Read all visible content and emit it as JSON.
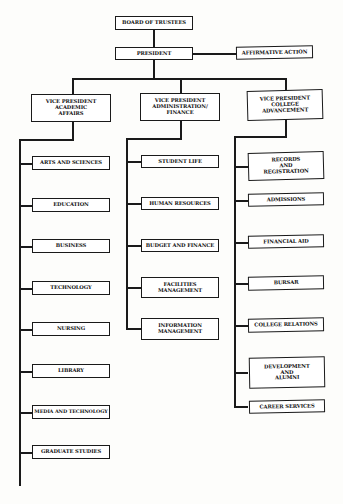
{
  "chart": {
    "board": "BOARD OF TRUSTEES",
    "president": "PRESIDENT",
    "affirmative_action": "AFFIRMATIVE ACTION",
    "vps": [
      {
        "title": "VICE PRESIDENT\nACADEMIC\nAFFAIRS",
        "units": [
          "ARTS AND SCIENCES",
          "EDUCATION",
          "BUSINESS",
          "TECHNOLOGY",
          "NURSING",
          "LIBRARY",
          "MEDIA AND TECHNOLOGY",
          "GRADUATE STUDIES"
        ]
      },
      {
        "title": "VICE PRESIDENT\nADMINISTRATION/\nFINANCE",
        "units": [
          "STUDENT LIFE",
          "HUMAN RESOURCES",
          "BUDGET AND FINANCE",
          "FACILITIES\nMANAGEMENT",
          "INFORMATION\nMANAGEMENT"
        ]
      },
      {
        "title": "VICE PRESIDENT\nCOLLEGE\nADVANCEMENT",
        "units": [
          "RECORDS\nAND\nREGISTRATION",
          "ADMISSIONS",
          "FINANCIAL AID",
          "BURSAR",
          "COLLEGE RELATIONS",
          "DEVELOPMENT\nAND\nALUMNI",
          "CAREER SERVICES"
        ]
      }
    ]
  }
}
